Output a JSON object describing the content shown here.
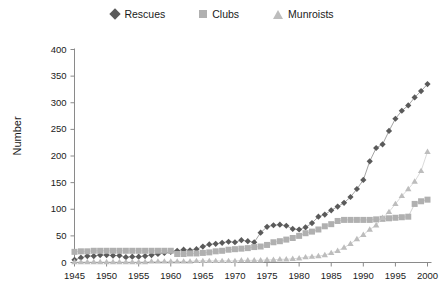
{
  "chart_data": {
    "type": "line",
    "title": "",
    "xlabel": "",
    "ylabel": "Number",
    "xlim": [
      1945,
      2000
    ],
    "ylim": [
      0,
      400
    ],
    "grid": false,
    "legend_position": "top-center",
    "x_ticks": [
      "1945",
      "1950",
      "1955",
      "1960",
      "1965",
      "1970",
      "1975",
      "1980",
      "1985",
      "1990",
      "1995",
      "2000"
    ],
    "y_ticks": [
      "0",
      "50",
      "100",
      "150",
      "200",
      "250",
      "300",
      "350",
      "400"
    ],
    "x": [
      1945,
      1946,
      1947,
      1948,
      1949,
      1950,
      1951,
      1952,
      1953,
      1954,
      1955,
      1956,
      1957,
      1958,
      1959,
      1960,
      1961,
      1962,
      1963,
      1964,
      1965,
      1966,
      1967,
      1968,
      1969,
      1970,
      1971,
      1972,
      1973,
      1974,
      1975,
      1976,
      1977,
      1978,
      1979,
      1980,
      1981,
      1982,
      1983,
      1984,
      1985,
      1986,
      1987,
      1988,
      1989,
      1990,
      1991,
      1992,
      1993,
      1994,
      1995,
      1996,
      1997,
      1998,
      1999,
      2000
    ],
    "series": [
      {
        "name": "Rescues",
        "marker": "diamond",
        "color": "#5a5a5a",
        "values": [
          5,
          9,
          12,
          12,
          14,
          14,
          13,
          13,
          10,
          11,
          11,
          12,
          14,
          16,
          18,
          20,
          22,
          24,
          23,
          25,
          30,
          34,
          35,
          37,
          39,
          38,
          42,
          40,
          38,
          56,
          67,
          70,
          71,
          69,
          63,
          62,
          66,
          74,
          86,
          90,
          98,
          105,
          112,
          123,
          138,
          155,
          190,
          215,
          222,
          247,
          270,
          285,
          295,
          310,
          322,
          335
        ]
      },
      {
        "name": "Clubs",
        "marker": "square",
        "color": "#b0b0b0",
        "values": [
          20,
          21,
          21,
          22,
          22,
          22,
          22,
          22,
          22,
          22,
          22,
          22,
          22,
          22,
          22,
          22,
          16,
          16,
          17,
          17,
          18,
          19,
          21,
          22,
          24,
          25,
          26,
          27,
          29,
          30,
          33,
          38,
          40,
          43,
          46,
          50,
          55,
          58,
          62,
          68,
          72,
          78,
          80,
          80,
          80,
          80,
          80,
          81,
          82,
          83,
          84,
          85,
          86,
          110,
          115,
          118
        ]
      },
      {
        "name": "Munroists",
        "marker": "triangle",
        "color": "#bdbdbd",
        "values": [
          1,
          1,
          1,
          1,
          1,
          1,
          1,
          1,
          1,
          1,
          1,
          1,
          2,
          2,
          2,
          2,
          2,
          2,
          2,
          3,
          3,
          3,
          3,
          3,
          3,
          3,
          4,
          4,
          4,
          4,
          5,
          5,
          6,
          6,
          7,
          8,
          10,
          11,
          12,
          14,
          18,
          22,
          28,
          35,
          44,
          52,
          62,
          70,
          84,
          95,
          110,
          125,
          138,
          152,
          172,
          208
        ]
      }
    ]
  }
}
